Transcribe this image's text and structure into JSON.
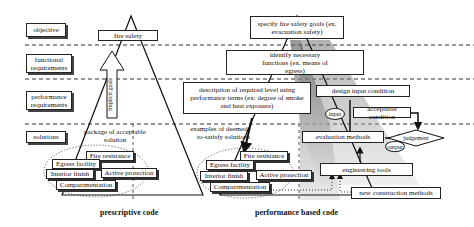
{
  "levels": {
    "objective": "objective",
    "functional": "functional requirements",
    "performance": "performance requirements",
    "solutions": "solutions"
  },
  "prescriptive": {
    "goal": "fire safety",
    "arrow_label": "Implicit goals",
    "package": "package of acceptable solution",
    "items": [
      "Fire resistance",
      "Egress facility",
      "Interior finish",
      "Active protection",
      "Compartmentation"
    ],
    "caption": "prescriptive code"
  },
  "performance_based": {
    "goals": "specify fire safety goals (ex. evacuation safety)",
    "functions": "identify necessary functions (ex. means of egress)",
    "description": "description of required level using performance terms (ex: degree of smoke and heat exposure)",
    "examples": "examples of deemed-to-satisfy solutions",
    "items": [
      "Fire resistance",
      "Egress facility",
      "Interior finish",
      "Active protection",
      "Compartmentation"
    ],
    "design_input": "design input condition",
    "input": "input",
    "acceptable": "acceptable condition",
    "evaluation": "evaluation methods",
    "output": "output",
    "judgement": "judgement",
    "tools": "engineering tools",
    "new_methods": "new construction methods",
    "caption": "performance based code"
  }
}
